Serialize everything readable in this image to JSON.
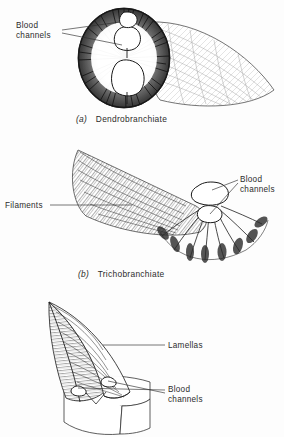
{
  "figure": {
    "background_color": "#fdfdfd",
    "ink_color": "#1e1e1e",
    "text_color": "#2c2c2c"
  },
  "panels": [
    {
      "id": "a",
      "caption_letter": "(a)",
      "caption_text": "Dendrobranchiate",
      "labels": [
        {
          "name": "blood-channels",
          "line1": "Blood",
          "line2": "channels",
          "position": "upper-left",
          "leader_count": 2
        }
      ]
    },
    {
      "id": "b",
      "caption_letter": "(b)",
      "caption_text": "Trichobranchiate",
      "labels": [
        {
          "name": "filaments",
          "line1": "Filaments",
          "line2": "",
          "position": "left",
          "leader_count": 1
        },
        {
          "name": "blood-channels",
          "line1": "Blood",
          "line2": "channels",
          "position": "right",
          "leader_count": 2
        }
      ]
    },
    {
      "id": "c",
      "caption_letter": "",
      "caption_text": "",
      "labels": [
        {
          "name": "lamellas",
          "line1": "Lamellas",
          "line2": "",
          "position": "right",
          "leader_count": 1
        },
        {
          "name": "blood-channels",
          "line1": "Blood",
          "line2": "channels",
          "position": "lower-right",
          "leader_count": 2
        }
      ]
    }
  ]
}
